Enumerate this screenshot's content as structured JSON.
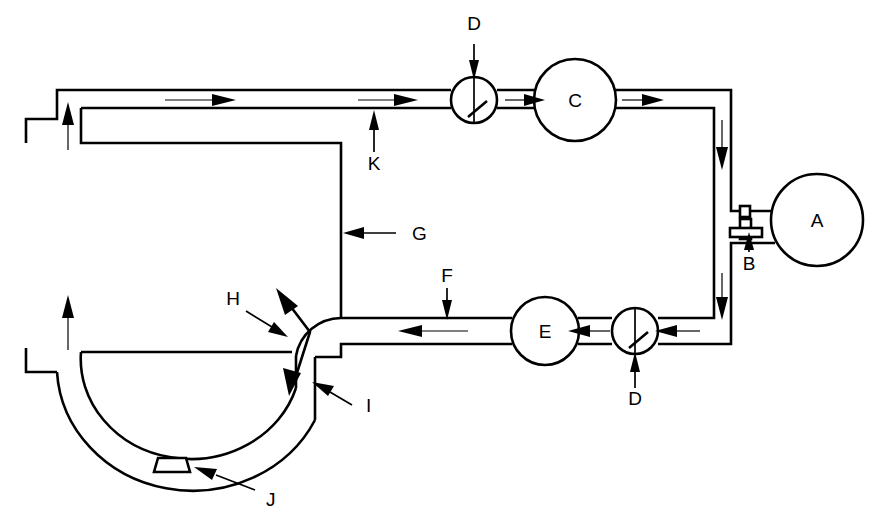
{
  "diagram": {
    "background_color": "#ffffff",
    "line_color": "#000000",
    "width": 881,
    "height": 531,
    "components": [
      {
        "id": "A",
        "label": "A",
        "kind": "reservoir-tank",
        "shape": "circle",
        "cx": 817,
        "cy": 220,
        "r": 46,
        "label_x": 817,
        "label_y": 227
      },
      {
        "id": "B",
        "label": "B",
        "kind": "stopcock-valve",
        "shape": "t-handle-valve",
        "cx": 748,
        "cy": 232,
        "label_x": 749,
        "label_y": 268
      },
      {
        "id": "C",
        "label": "C",
        "kind": "pump-chamber-upper",
        "shape": "circle",
        "cx": 575,
        "cy": 100,
        "r": 41,
        "label_x": 575,
        "label_y": 107
      },
      {
        "id": "D-upper",
        "label": "D",
        "kind": "check-valve",
        "shape": "circle-with-flap",
        "cx": 474,
        "cy": 100,
        "r": 23,
        "label_x": 474,
        "label_y": 30
      },
      {
        "id": "D-lower",
        "label": "D",
        "kind": "check-valve",
        "shape": "circle-with-flap",
        "cx": 635,
        "cy": 331,
        "r": 23,
        "label_x": 635,
        "label_y": 403
      },
      {
        "id": "E",
        "label": "E",
        "kind": "pump-chamber-lower",
        "shape": "circle",
        "cx": 545,
        "cy": 331,
        "r": 34,
        "label_x": 545,
        "label_y": 338
      },
      {
        "id": "F",
        "label": "F",
        "kind": "lower-return-channel",
        "label_x": 447,
        "label_y": 282
      },
      {
        "id": "G",
        "label": "G",
        "kind": "inner-wall",
        "label_x": 410,
        "label_y": 238
      },
      {
        "id": "H",
        "label": "H",
        "kind": "bidirectional-flow-zone",
        "label_x": 232,
        "label_y": 305
      },
      {
        "id": "I",
        "label": "I",
        "kind": "outer-jacket-wall",
        "label_x": 373,
        "label_y": 410
      },
      {
        "id": "J",
        "label": "J",
        "kind": "drain-port",
        "shape": "trapezoid",
        "label_x": 270,
        "label_y": 503
      },
      {
        "id": "K",
        "label": "K",
        "kind": "upper-supply-channel",
        "label_x": 374,
        "label_y": 168
      }
    ],
    "flow_arrows": [
      {
        "id": "top-left-1",
        "direction": "right",
        "x": 175,
        "y": 100
      },
      {
        "id": "top-left-2",
        "direction": "right",
        "x": 375,
        "y": 100
      },
      {
        "id": "top-c-in",
        "direction": "right",
        "x": 515,
        "y": 100
      },
      {
        "id": "top-c-out",
        "direction": "right",
        "x": 630,
        "y": 100
      },
      {
        "id": "right-down-1",
        "direction": "down",
        "x": 718,
        "y": 140
      },
      {
        "id": "right-down-2",
        "direction": "down",
        "x": 718,
        "y": 290
      },
      {
        "id": "bot-e-in-r",
        "direction": "left",
        "x": 678,
        "y": 331
      },
      {
        "id": "bot-e-in-l",
        "direction": "left",
        "x": 592,
        "y": 331
      },
      {
        "id": "bot-left",
        "direction": "left",
        "x": 420,
        "y": 331
      },
      {
        "id": "left-up-low",
        "direction": "up",
        "x": 68,
        "y": 320
      },
      {
        "id": "left-up-top",
        "direction": "up",
        "x": 68,
        "y": 125
      },
      {
        "id": "h-bidir",
        "direction": "bidirectional-bent",
        "x": 300,
        "y": 330
      }
    ]
  }
}
